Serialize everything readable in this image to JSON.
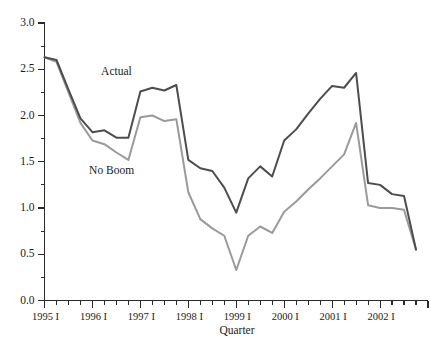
{
  "chart_data": {
    "type": "line",
    "title": "",
    "xlabel": "Quarter",
    "ylabel": "",
    "ylim": [
      0.0,
      3.0
    ],
    "ytick_values": [
      0.0,
      0.5,
      1.0,
      1.5,
      2.0,
      2.5,
      3.0
    ],
    "ytick_labels": [
      "0.0",
      "0.5",
      "1.0",
      "1.5",
      "2.0",
      "2.5",
      "3.0"
    ],
    "y_minor_step": 0.25,
    "grid": false,
    "legend_position": "inline-annotation",
    "x": [
      "1995 I",
      "1995 II",
      "1995 III",
      "1995 IV",
      "1996 I",
      "1996 II",
      "1996 III",
      "1996 IV",
      "1997 I",
      "1997 II",
      "1997 III",
      "1997 IV",
      "1998 I",
      "1998 II",
      "1998 III",
      "1998 IV",
      "1999 I",
      "1999 II",
      "1999 III",
      "1999 IV",
      "2000 I",
      "2000 II",
      "2000 III",
      "2000 IV",
      "2001 I",
      "2001 II",
      "2001 III",
      "2001 IV",
      "2002 I",
      "2002 II",
      "2002 III",
      "2002 IV"
    ],
    "xtick_major_labels": [
      "1995 I",
      "1996 I",
      "1997 I",
      "1998 I",
      "1999 I",
      "2000 I",
      "2001 I",
      "2002 I"
    ],
    "xtick_major_indices": [
      0,
      4,
      8,
      12,
      16,
      20,
      24,
      28
    ],
    "series": [
      {
        "name": "Actual",
        "color": "#4d4d4d",
        "label_x_index": 6.0,
        "label_y_value": 2.44,
        "values": [
          2.63,
          2.6,
          2.28,
          1.97,
          1.82,
          1.84,
          1.76,
          1.76,
          2.26,
          2.3,
          2.27,
          2.33,
          1.52,
          1.43,
          1.4,
          1.22,
          0.95,
          1.32,
          1.45,
          1.34,
          1.73,
          1.85,
          2.02,
          2.18,
          2.32,
          2.3,
          2.46,
          1.27,
          1.25,
          1.15,
          1.13,
          0.55
        ]
      },
      {
        "name": "No Boom",
        "color": "#9a9a9a",
        "label_x_index": 5.6,
        "label_y_value": 1.37,
        "values": [
          2.63,
          2.58,
          2.25,
          1.92,
          1.73,
          1.69,
          1.6,
          1.52,
          1.98,
          2.0,
          1.94,
          1.96,
          1.17,
          0.88,
          0.78,
          0.7,
          0.33,
          0.7,
          0.8,
          0.73,
          0.96,
          1.07,
          1.2,
          1.32,
          1.45,
          1.58,
          1.92,
          1.03,
          1.0,
          1.0,
          0.98,
          0.55
        ]
      }
    ]
  },
  "axis": {
    "x_title": "Quarter"
  }
}
